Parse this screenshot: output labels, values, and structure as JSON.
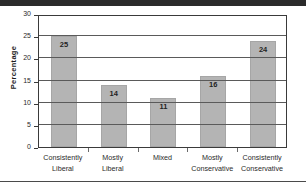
{
  "chart_data": {
    "type": "bar",
    "title": "",
    "xlabel": "",
    "ylabel": "Percentage",
    "ylim": [
      0,
      30
    ],
    "yticks": [
      0,
      5,
      10,
      15,
      20,
      25,
      30
    ],
    "grid": true,
    "legend": "none",
    "bar_color": "#b4b4b4",
    "categories": [
      "Consistently Liberal",
      "Mostly Liberal",
      "Mixed",
      "Mostly Conservative",
      "Consistently Conservative"
    ],
    "category_lines": [
      [
        "Consistently",
        "Liberal"
      ],
      [
        "Mostly",
        "Liberal"
      ],
      [
        "Mixed",
        ""
      ],
      [
        "Mostly",
        "Conservative"
      ],
      [
        "Consistently",
        "Conservative"
      ]
    ],
    "values": [
      25,
      14,
      11,
      16,
      24
    ],
    "value_labels": [
      "25",
      "14",
      "11",
      "16",
      "24"
    ]
  },
  "axis": {
    "tick_labels": [
      "0",
      "5",
      "10",
      "15",
      "20",
      "25",
      "30"
    ]
  }
}
